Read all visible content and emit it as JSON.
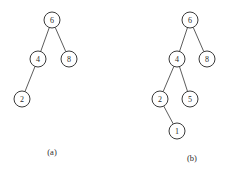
{
  "figure": {
    "background_color": "#ffffff",
    "stroke_color": "#3a3a3a",
    "edge_color": "#4a4a4a",
    "text_color": "#2b2b2b",
    "width": 235,
    "height": 173
  },
  "chart_data": {
    "type": "diagram",
    "diagram_kind": "binary-search-tree",
    "title": "",
    "panels": [
      {
        "caption": "(a)",
        "caption_x": 52,
        "caption_y": 152,
        "node_radius": 8,
        "nodes": [
          {
            "id": "a6",
            "label": "6",
            "x": 52,
            "y": 20
          },
          {
            "id": "a4",
            "label": "4",
            "x": 38,
            "y": 59
          },
          {
            "id": "a8",
            "label": "8",
            "x": 69,
            "y": 59
          },
          {
            "id": "a2",
            "label": "2",
            "x": 22,
            "y": 99
          }
        ],
        "edges": [
          {
            "from": "a6",
            "to": "a4"
          },
          {
            "from": "a6",
            "to": "a8"
          },
          {
            "from": "a4",
            "to": "a2"
          }
        ]
      },
      {
        "caption": "(b)",
        "caption_x": 192,
        "caption_y": 158,
        "node_radius": 8,
        "nodes": [
          {
            "id": "b6",
            "label": "6",
            "x": 190,
            "y": 20
          },
          {
            "id": "b4",
            "label": "4",
            "x": 177,
            "y": 59
          },
          {
            "id": "b8",
            "label": "8",
            "x": 207,
            "y": 59
          },
          {
            "id": "b2",
            "label": "2",
            "x": 160,
            "y": 99
          },
          {
            "id": "b5",
            "label": "5",
            "x": 190,
            "y": 99
          },
          {
            "id": "b1",
            "label": "1",
            "x": 177,
            "y": 131
          }
        ],
        "edges": [
          {
            "from": "b6",
            "to": "b4"
          },
          {
            "from": "b6",
            "to": "b8"
          },
          {
            "from": "b4",
            "to": "b2"
          },
          {
            "from": "b4",
            "to": "b5"
          },
          {
            "from": "b2",
            "to": "b1"
          }
        ]
      }
    ]
  }
}
